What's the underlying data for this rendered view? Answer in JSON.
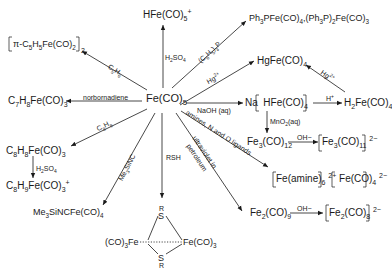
{
  "center": {
    "formula": "Fe(CO)5"
  },
  "products": {
    "hfeco5": "HFe(CO)5+",
    "ph3p": "Ph3PFe(CO)4, (Ph3P)2Fe(CO)3",
    "hgfeco4": "HgFe(CO)4",
    "nahfeco4": "Na[HFe(CO)4]",
    "h2feco4": "H2Fe(CO)4",
    "fe3co12": "Fe3(CO)12",
    "fe3co11": "[Fe3(CO)11]2-",
    "amine_salt": "[Fe(amine)6]2+[Fe(CO)4]2-",
    "fe2co9": "Fe2(CO)9",
    "fe2co8": "[Fe2(CO)8]2-",
    "thiolate_dimer": "(CO)3Fe(SR)2Fe(CO)3",
    "me3sinc": "Me3SiNCFe(CO)4",
    "c8h8": "C8H8Fe(CO)3",
    "c8h9": "C8H9Fe(CO)3+",
    "c7h8": "C7H8Fe(CO)3",
    "cp_dimer": "[π-C5H5Fe(CO)2]2"
  },
  "reagents": {
    "h2so4_top": "H2SO4",
    "ph3p": "(C6H5)3P",
    "hg_left": "Hg2+",
    "hg_right": "Hg2+",
    "naoh": "NaOH (aq)",
    "h_plus": "H+",
    "mno2": "MnO2(aq)",
    "oh_fe3": "OH−",
    "amines": "amines, N and O ligands",
    "uv": "ultraviolet in petroleum",
    "oh_fe2": "OH−",
    "rsh": "RSH",
    "me3sinc": "Me3SiNC",
    "c8h8": "C8H8",
    "h2so4_left": "H2SO4",
    "norbornadiene": "norbornadiene",
    "c5h6": "C5H6"
  },
  "thiolate": {
    "r_top": "R",
    "s_top": "S",
    "s_bottom": "S",
    "r_bottom": "R",
    "left": "(CO)3Fe",
    "right": "Fe(CO)3"
  }
}
